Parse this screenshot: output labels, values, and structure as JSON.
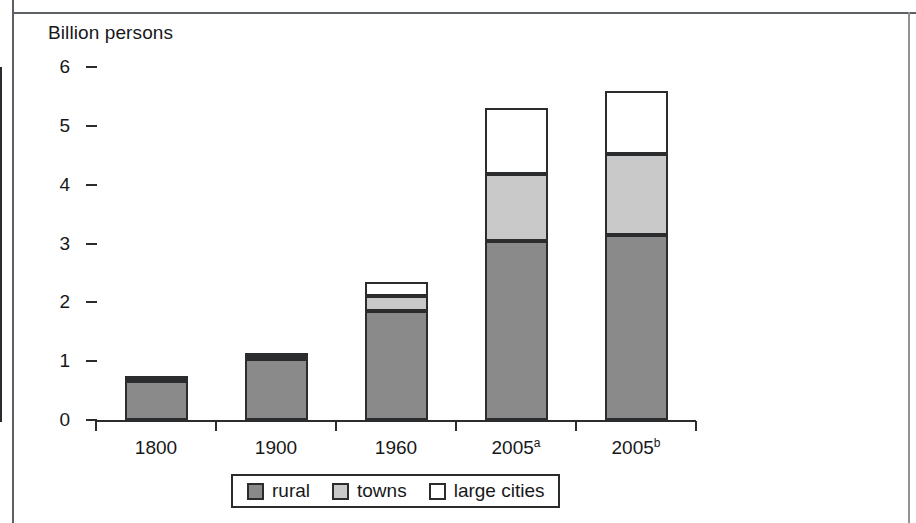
{
  "chart_data": {
    "type": "bar",
    "subtype": "stacked",
    "title": "Billion persons",
    "xlabel": "",
    "ylabel": "Billion persons",
    "ylim": [
      0,
      6
    ],
    "yticks": [
      0,
      1,
      2,
      3,
      4,
      5,
      6
    ],
    "ytick_labels": [
      "0",
      "1",
      "2",
      "3",
      "4",
      "5",
      "6"
    ],
    "grid": false,
    "legend_position": "bottom",
    "categories": [
      "1800",
      "1900",
      "1960",
      "2005a",
      "2005b"
    ],
    "category_labels": [
      {
        "base": "1800",
        "sup": ""
      },
      {
        "base": "1900",
        "sup": ""
      },
      {
        "base": "1960",
        "sup": ""
      },
      {
        "base": "2005",
        "sup": "a"
      },
      {
        "base": "2005",
        "sup": "b"
      }
    ],
    "series": [
      {
        "name": "rural",
        "color": "#8a8a8a",
        "values": [
          0.66,
          1.04,
          1.85,
          3.05,
          3.15
        ]
      },
      {
        "name": "towns",
        "color": "#c9c9c9",
        "values": [
          0.02,
          0.03,
          0.26,
          1.14,
          1.37
        ]
      },
      {
        "name": "large cities",
        "color": "#ffffff",
        "values": [
          0.03,
          0.05,
          0.24,
          1.12,
          1.08
        ]
      }
    ],
    "totals": [
      0.71,
      1.12,
      2.35,
      5.31,
      5.6
    ],
    "legend": [
      "rural",
      "towns",
      "large cities"
    ]
  },
  "figure": {
    "axis_title": "Billion persons"
  }
}
